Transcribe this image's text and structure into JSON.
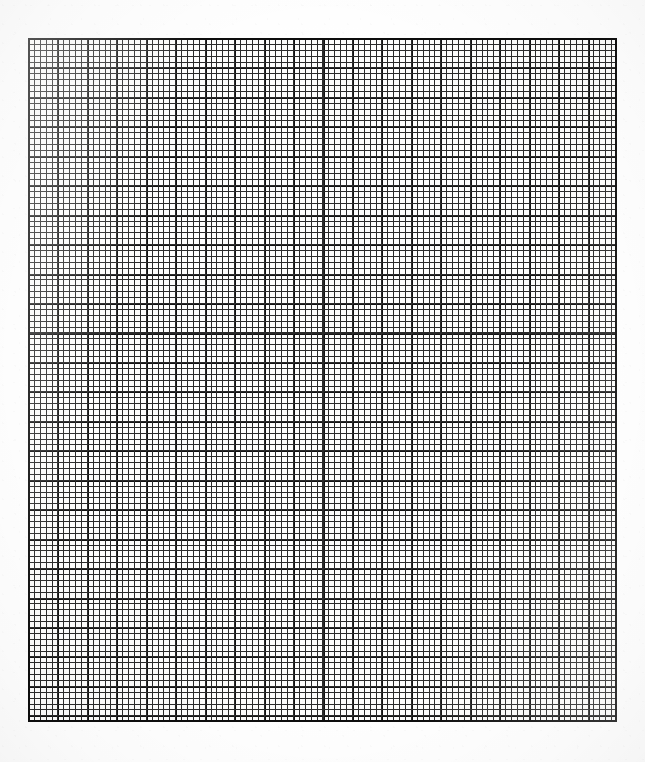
{
  "document": {
    "kind": "graph-paper",
    "title": "Graph Paper Grid Sheet",
    "background_color": "#ffffff",
    "page_width": 645,
    "page_height": 762
  },
  "grid": {
    "label": "engineering grid",
    "origin_x": 28,
    "origin_y": 38,
    "width": 589,
    "height": 684,
    "minor_cell_size": 5.89,
    "major_cell_size": 29.45,
    "minor_per_major": 5,
    "minor_columns": 100,
    "minor_rows": 116,
    "major_columns": 20,
    "major_rows": 23.2,
    "minor_line_color": "#2a2a2a",
    "major_line_color": "#111111",
    "border_color": "#0d0d0d",
    "minor_line_width": 1,
    "major_line_width": 2,
    "border_line_width": 2,
    "cell_fill_color": "#fdfdfc"
  },
  "chart_data": {
    "type": "table",
    "xlabel": "",
    "ylabel": "",
    "categories": [],
    "values": [],
    "grid": true,
    "legend": "none"
  }
}
